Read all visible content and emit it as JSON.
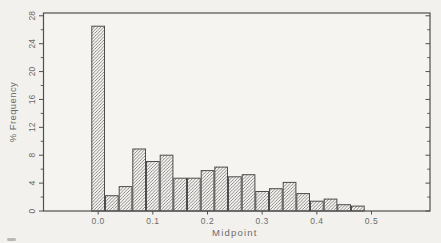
{
  "figure": {
    "background_color": "#f2f1ed",
    "plot_bg_color": "#f5f4f0"
  },
  "chart_data": {
    "type": "bar",
    "subtype": "histogram",
    "title": "",
    "xlabel": "Midpoint",
    "ylabel": "% Frequency",
    "bin_width": 0.025,
    "midpoints": [
      0.0,
      0.025,
      0.05,
      0.075,
      0.1,
      0.125,
      0.15,
      0.175,
      0.2,
      0.225,
      0.25,
      0.275,
      0.3,
      0.325,
      0.35,
      0.375,
      0.4,
      0.425,
      0.45,
      0.475
    ],
    "values": [
      26.5,
      2.2,
      3.5,
      8.9,
      7.1,
      8.0,
      4.7,
      4.7,
      5.8,
      6.3,
      4.9,
      5.2,
      2.8,
      3.2,
      4.1,
      2.5,
      1.4,
      1.7,
      0.9,
      0.7
    ],
    "x_tick_labels": [
      "0.0",
      "0.1",
      "0.2",
      "0.3",
      "0.4",
      "0.5"
    ],
    "x_tick_values": [
      0.0,
      0.1,
      0.2,
      0.3,
      0.4,
      0.5
    ],
    "y_tick_labels": [
      "0",
      "4",
      "8",
      "12",
      "16",
      "20",
      "24",
      "28"
    ],
    "y_tick_values": [
      0,
      4,
      8,
      12,
      16,
      20,
      24,
      28
    ],
    "y_minor_tick_values": [
      2,
      6,
      10,
      14,
      18,
      22,
      26
    ],
    "xlim": [
      -0.1,
      0.607
    ],
    "ylim": [
      0,
      28.4
    ],
    "grid": false,
    "legend": "none",
    "bar_fill": "diagonal-hatch",
    "hatch_color": "#6f6f6f",
    "bar_edge_color": "#4d4d4d",
    "axis_color": "#4f4f4f",
    "tick_label_color": "#6c6c6c",
    "axis_title_color": "#6c6c6c"
  }
}
